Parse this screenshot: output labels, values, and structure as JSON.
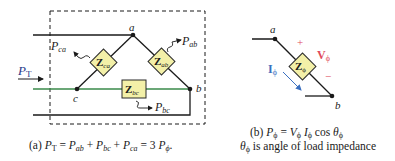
{
  "figure_a": {
    "nodes": {
      "a": "a",
      "b": "b",
      "c": "c"
    },
    "impedances": {
      "ca": {
        "main": "Z",
        "sub": "ca"
      },
      "ab": {
        "main": "Z",
        "sub": "ab"
      },
      "bc": {
        "main": "Z",
        "sub": "bc"
      }
    },
    "powers": {
      "ca": {
        "main": "P",
        "sub": "ca"
      },
      "ab": {
        "main": "P",
        "sub": "ab"
      },
      "bc": {
        "main": "P",
        "sub": "bc"
      },
      "total": {
        "main": "P",
        "sub": "T"
      }
    },
    "caption": {
      "prefix": "(a) ",
      "p": "P",
      "t": "T",
      "eq": " = ",
      "ab": "ab",
      "plus": " + ",
      "bc": "bc",
      "ca": "ca",
      "three": " = 3 ",
      "phi": "ϕ",
      "end": "."
    }
  },
  "figure_b": {
    "nodes": {
      "a": "a",
      "b": "b"
    },
    "impedance": {
      "main": "Z",
      "sub": "ϕ"
    },
    "voltage": {
      "main": "V",
      "sub": "ϕ",
      "plus": "+",
      "minus": "−"
    },
    "current": {
      "main": "I",
      "sub": "ϕ"
    },
    "caption_line1": {
      "prefix": "(b) ",
      "p": "P",
      "phi": "ϕ",
      "eq": " = ",
      "v": "V",
      "i": "I",
      "cos": " cos ",
      "theta": "θ"
    },
    "caption_line2": {
      "theta": "θ",
      "phi": "ϕ",
      "text": " is angle of load impedance"
    }
  },
  "colors": {
    "wire": "#1a1a1a",
    "green_wire": "#3a8a4a",
    "impedance_fill": "#f3f0a8",
    "impedance_stroke": "#2a2a2a",
    "voltage_red": "#e04a5a",
    "current_blue": "#3a6fc0",
    "label_blue": "#2a3a8a"
  }
}
